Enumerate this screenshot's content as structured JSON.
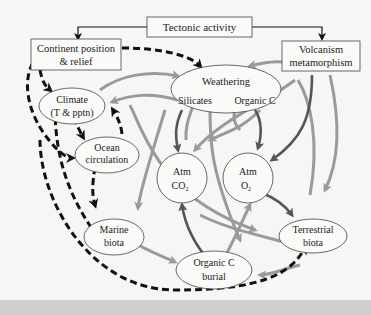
{
  "diagram": {
    "nodes": {
      "tectonic": {
        "label": "Tectonic activity",
        "shape": "rect"
      },
      "continent": {
        "line1": "Continent position",
        "line2": "& relief",
        "shape": "rect"
      },
      "volcanism": {
        "line1": "Volcanism",
        "line2": "metamorphism",
        "shape": "rect"
      },
      "climate": {
        "line1": "Climate",
        "line2": "(T & pptn)",
        "shape": "ellipse"
      },
      "ocean": {
        "line1": "Ocean",
        "line2": "circulation",
        "shape": "ellipse"
      },
      "weathering": {
        "title": "Weathering",
        "sub1": "Silicates",
        "sub2": "Organic C",
        "shape": "ellipse"
      },
      "atm_co2": {
        "line1": "Atm",
        "line2": "CO",
        "sub": "2",
        "shape": "circle"
      },
      "atm_o2": {
        "line1": "Atm",
        "line2": "O",
        "sub": "2",
        "shape": "circle"
      },
      "marine": {
        "line1": "Marine",
        "line2": "biota",
        "shape": "ellipse"
      },
      "terrestrial": {
        "line1": "Terrestrial",
        "line2": "biota",
        "shape": "ellipse"
      },
      "burial": {
        "line1": "Organic C",
        "line2": "burial",
        "shape": "ellipse"
      }
    },
    "edge_styles": {
      "solid_black": "#1a1a1a",
      "dashed_black": "#111111",
      "light_gray": "#9a9a9a",
      "dark_gray": "#555555"
    }
  }
}
